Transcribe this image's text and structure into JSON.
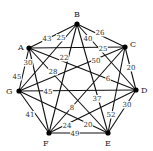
{
  "graph": {
    "nodes": [
      {
        "id": "A",
        "x": 29,
        "y": 48,
        "lx": 18,
        "ly": 50
      },
      {
        "id": "B",
        "x": 77,
        "y": 24,
        "lx": 74,
        "ly": 17
      },
      {
        "id": "C",
        "x": 125,
        "y": 47,
        "lx": 130,
        "ly": 47
      },
      {
        "id": "D",
        "x": 136,
        "y": 90,
        "lx": 141,
        "ly": 93
      },
      {
        "id": "E",
        "x": 108,
        "y": 133,
        "lx": 105,
        "ly": 146
      },
      {
        "id": "F",
        "x": 49,
        "y": 133,
        "lx": 43,
        "ly": 146
      },
      {
        "id": "G",
        "x": 19,
        "y": 91,
        "lx": 6,
        "ly": 94
      }
    ],
    "edges": [
      {
        "from": "A",
        "to": "B",
        "w": "43",
        "lx": 47,
        "ly": 41
      },
      {
        "from": "B",
        "to": "C",
        "w": "26",
        "lx": 100,
        "ly": 35
      },
      {
        "from": "C",
        "to": "D",
        "w": "20",
        "lx": 131,
        "ly": 70
      },
      {
        "from": "D",
        "to": "E",
        "w": "30",
        "lx": 127,
        "ly": 107
      },
      {
        "from": "E",
        "to": "F",
        "w": "49",
        "lx": 75,
        "ly": 136
      },
      {
        "from": "F",
        "to": "G",
        "w": "41",
        "lx": 30,
        "ly": 117
      },
      {
        "from": "G",
        "to": "A",
        "w": "45",
        "lx": 17,
        "ly": 79
      },
      {
        "from": "A",
        "to": "C",
        "w": "25",
        "lx": 103,
        "ly": 51
      },
      {
        "from": "B",
        "to": "G",
        "w": "25",
        "lx": 61,
        "ly": 40
      },
      {
        "from": "A",
        "to": "D",
        "w": "6",
        "lx": 108,
        "ly": 81
      },
      {
        "from": "A",
        "to": "E",
        "w": "28",
        "lx": 53,
        "ly": 74
      },
      {
        "from": "A",
        "to": "F",
        "w": "30",
        "lx": 28,
        "ly": 65
      },
      {
        "from": "B",
        "to": "F",
        "w": "22",
        "lx": 64,
        "ly": 60
      },
      {
        "from": "B",
        "to": "E",
        "w": "37",
        "lx": 97,
        "ly": 101
      },
      {
        "from": "B",
        "to": "D",
        "w": "40",
        "lx": 88,
        "ly": 41
      },
      {
        "from": "C",
        "to": "G",
        "w": "50",
        "lx": 96,
        "ly": 63
      },
      {
        "from": "C",
        "to": "F",
        "w": "8",
        "lx": 72,
        "ly": 110
      },
      {
        "from": "C",
        "to": "E",
        "w": "52",
        "lx": 111,
        "ly": 117
      },
      {
        "from": "G",
        "to": "D",
        "w": "45",
        "lx": 48,
        "ly": 94
      },
      {
        "from": "G",
        "to": "E",
        "w": "20",
        "lx": 88,
        "ly": 127
      },
      {
        "from": "D",
        "to": "F",
        "w": "24",
        "lx": 67,
        "ly": 128
      }
    ]
  }
}
